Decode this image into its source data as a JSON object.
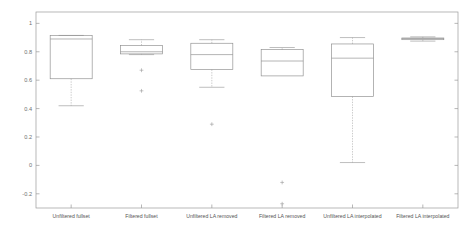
{
  "chart_data": {
    "type": "box",
    "title": "",
    "xlabel": "",
    "ylabel": "",
    "ylim": [
      -0.3,
      1.08
    ],
    "yticks": [
      -0.2,
      0,
      0.2,
      0.4,
      0.6,
      0.8,
      1
    ],
    "ytick_labels": [
      "-0.2",
      "0",
      "0.2",
      "0.4",
      "0.6",
      "0.8",
      "1"
    ],
    "grid": false,
    "legend": "none",
    "categories": [
      "Unfiltered fullset",
      "Filtered fullset",
      "Unfiltered LA removed",
      "Filtered LA removed",
      "Unfiltered LA interpolated",
      "Filtered LA interpolated"
    ],
    "boxes": [
      {
        "label": "Unfiltered fullset",
        "whisker_low": 0.42,
        "q1": 0.61,
        "median": 0.89,
        "q3": 0.915,
        "whisker_high": 0.915,
        "outliers": []
      },
      {
        "label": "Filtered fullset",
        "whisker_low": 0.78,
        "q1": 0.785,
        "median": 0.8,
        "q3": 0.845,
        "whisker_high": 0.885,
        "outliers": [
          0.67,
          0.525
        ]
      },
      {
        "label": "Unfiltered LA removed",
        "whisker_low": 0.55,
        "q1": 0.675,
        "median": 0.78,
        "q3": 0.86,
        "whisker_high": 0.885,
        "outliers": [
          0.29
        ]
      },
      {
        "label": "Filtered LA removed",
        "whisker_low": 0.63,
        "q1": 0.63,
        "median": 0.735,
        "q3": 0.815,
        "whisker_high": 0.83,
        "outliers": [
          -0.12,
          -0.27
        ]
      },
      {
        "label": "Unfiltered LA interpolated",
        "whisker_low": 0.02,
        "q1": 0.485,
        "median": 0.755,
        "q3": 0.855,
        "whisker_high": 0.9,
        "outliers": []
      },
      {
        "label": "Filtered LA interpolated",
        "whisker_low": 0.875,
        "q1": 0.885,
        "median": 0.893,
        "q3": 0.897,
        "whisker_high": 0.905,
        "outliers": []
      }
    ],
    "colors": {
      "box_stroke": "#8c8c8c",
      "median_stroke": "#8c8c8c",
      "whisker_stroke": "#a8a8a8",
      "axis_stroke": "#9a9a9a",
      "background": "#ffffff"
    }
  }
}
